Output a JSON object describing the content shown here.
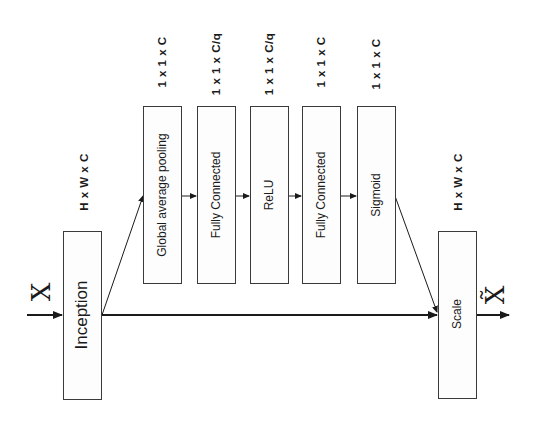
{
  "diagram": {
    "orientation": "rotated -90deg",
    "input_symbol": "X",
    "output_symbol": "X̃",
    "blocks": [
      {
        "id": "inception",
        "label": "Inception",
        "dim": "H x W x C"
      },
      {
        "id": "gap",
        "label": "Global average pooling",
        "dim": "1 x 1 x C"
      },
      {
        "id": "fc1",
        "label": "Fully Connected",
        "dim": "1 x 1 x C/q"
      },
      {
        "id": "relu",
        "label": "ReLU",
        "dim": "1 x 1 x C/q"
      },
      {
        "id": "fc2",
        "label": "Fully Connected",
        "dim": "1 x 1 x C"
      },
      {
        "id": "sigmoid",
        "label": "Sigmoid",
        "dim": "1 x 1 x C"
      },
      {
        "id": "scale",
        "label": "Scale",
        "dim": "H x W x C"
      }
    ],
    "edges": [
      {
        "from": "input",
        "to": "inception"
      },
      {
        "from": "inception",
        "to": "gap"
      },
      {
        "from": "gap",
        "to": "fc1"
      },
      {
        "from": "fc1",
        "to": "relu"
      },
      {
        "from": "relu",
        "to": "fc2"
      },
      {
        "from": "fc2",
        "to": "sigmoid"
      },
      {
        "from": "sigmoid",
        "to": "scale"
      },
      {
        "from": "inception",
        "to": "scale"
      },
      {
        "from": "scale",
        "to": "output"
      }
    ]
  }
}
